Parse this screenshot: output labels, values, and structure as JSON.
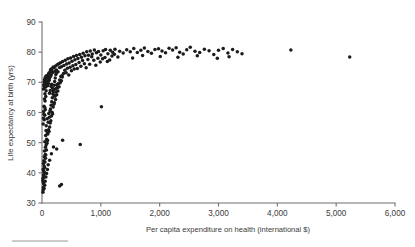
{
  "chart_data": {
    "type": "scatter",
    "title": "",
    "xlabel": "Per capita expenditure on health (international $)",
    "ylabel": "Life expectancy at birth (yrs)",
    "xlim": [
      0,
      6000
    ],
    "ylim": [
      30,
      90
    ],
    "xticks": [
      0,
      1000,
      2000,
      3000,
      4000,
      5000,
      6000
    ],
    "xticklabels": [
      "0",
      "1,000",
      "2,000",
      "3,000",
      "4,000",
      "5,000",
      "6,000"
    ],
    "yticks": [
      30,
      40,
      50,
      60,
      70,
      80,
      90
    ],
    "yticklabels": [
      "30",
      "40",
      "50",
      "60",
      "70",
      "80",
      "90"
    ],
    "grid": false,
    "legend": false,
    "marker_color": "#1b1b1b",
    "axis_color": "#6f6f6f",
    "points": [
      [
        15,
        37.5
      ],
      [
        18,
        38.2
      ],
      [
        22,
        36.8
      ],
      [
        25,
        39.4
      ],
      [
        28,
        40.6
      ],
      [
        20,
        41.2
      ],
      [
        32,
        38.9
      ],
      [
        35,
        42.3
      ],
      [
        24,
        43.1
      ],
      [
        30,
        44.0
      ],
      [
        40,
        40.2
      ],
      [
        45,
        41.8
      ],
      [
        38,
        45.3
      ],
      [
        50,
        43.6
      ],
      [
        55,
        46.1
      ],
      [
        42,
        47.2
      ],
      [
        60,
        44.8
      ],
      [
        58,
        48.5
      ],
      [
        65,
        45.9
      ],
      [
        70,
        49.2
      ],
      [
        48,
        50.3
      ],
      [
        75,
        47.6
      ],
      [
        80,
        51.1
      ],
      [
        62,
        52.4
      ],
      [
        85,
        49.8
      ],
      [
        90,
        53.2
      ],
      [
        68,
        54.0
      ],
      [
        95,
        50.7
      ],
      [
        100,
        52.9
      ],
      [
        72,
        55.6
      ],
      [
        110,
        54.3
      ],
      [
        105,
        56.8
      ],
      [
        120,
        53.7
      ],
      [
        88,
        57.9
      ],
      [
        130,
        55.2
      ],
      [
        125,
        58.4
      ],
      [
        140,
        56.5
      ],
      [
        115,
        59.7
      ],
      [
        150,
        57.3
      ],
      [
        135,
        60.5
      ],
      [
        160,
        58.8
      ],
      [
        145,
        61.2
      ],
      [
        170,
        60.1
      ],
      [
        155,
        62.4
      ],
      [
        180,
        59.5
      ],
      [
        190,
        61.8
      ],
      [
        165,
        63.6
      ],
      [
        200,
        62.7
      ],
      [
        175,
        64.9
      ],
      [
        210,
        63.2
      ],
      [
        220,
        65.4
      ],
      [
        185,
        66.1
      ],
      [
        230,
        64.3
      ],
      [
        240,
        66.8
      ],
      [
        195,
        67.5
      ],
      [
        250,
        65.9
      ],
      [
        260,
        68.2
      ],
      [
        205,
        69.0
      ],
      [
        270,
        67.1
      ],
      [
        280,
        69.6
      ],
      [
        215,
        70.3
      ],
      [
        290,
        68.5
      ],
      [
        300,
        70.8
      ],
      [
        225,
        71.4
      ],
      [
        310,
        69.9
      ],
      [
        320,
        71.9
      ],
      [
        235,
        72.6
      ],
      [
        330,
        70.5
      ],
      [
        340,
        72.2
      ],
      [
        245,
        73.1
      ],
      [
        28,
        60.3
      ],
      [
        34,
        62.1
      ],
      [
        42,
        64.5
      ],
      [
        50,
        66.2
      ],
      [
        58,
        68.4
      ],
      [
        26,
        58.1
      ],
      [
        33,
        59.4
      ],
      [
        45,
        61.7
      ],
      [
        52,
        63.8
      ],
      [
        64,
        65.3
      ],
      [
        20,
        56.2
      ],
      [
        38,
        57.6
      ],
      [
        48,
        59.1
      ],
      [
        56,
        61.0
      ],
      [
        70,
        67.2
      ],
      [
        30,
        69.1
      ],
      [
        36,
        70.2
      ],
      [
        44,
        70.9
      ],
      [
        54,
        71.5
      ],
      [
        66,
        72.0
      ],
      [
        25,
        67.8
      ],
      [
        40,
        68.6
      ],
      [
        46,
        69.8
      ],
      [
        60,
        70.6
      ],
      [
        74,
        71.2
      ],
      [
        80,
        69.3
      ],
      [
        92,
        70.4
      ],
      [
        104,
        71.7
      ],
      [
        86,
        72.3
      ],
      [
        98,
        70.1
      ],
      [
        112,
        72.8
      ],
      [
        124,
        71.3
      ],
      [
        136,
        73.4
      ],
      [
        148,
        72.1
      ],
      [
        160,
        73.9
      ],
      [
        95,
        68.9
      ],
      [
        108,
        69.6
      ],
      [
        122,
        70.7
      ],
      [
        118,
        73.1
      ],
      [
        132,
        71.6
      ],
      [
        144,
        74.2
      ],
      [
        156,
        72.5
      ],
      [
        168,
        74.6
      ],
      [
        180,
        73.3
      ],
      [
        192,
        75.1
      ],
      [
        128,
        66.4
      ],
      [
        140,
        67.3
      ],
      [
        152,
        68.7
      ],
      [
        164,
        69.4
      ],
      [
        176,
        68.1
      ],
      [
        205,
        74.8
      ],
      [
        218,
        73.7
      ],
      [
        232,
        75.4
      ],
      [
        246,
        74.1
      ],
      [
        258,
        75.8
      ],
      [
        272,
        73.5
      ],
      [
        286,
        76.2
      ],
      [
        300,
        74.9
      ],
      [
        315,
        76.5
      ],
      [
        330,
        75.2
      ],
      [
        190,
        66.8
      ],
      [
        210,
        65.7
      ],
      [
        230,
        67.9
      ],
      [
        250,
        69.2
      ],
      [
        265,
        68.3
      ],
      [
        350,
        76.9
      ],
      [
        372,
        75.6
      ],
      [
        395,
        77.3
      ],
      [
        418,
        76.1
      ],
      [
        440,
        77.8
      ],
      [
        462,
        76.4
      ],
      [
        485,
        78.1
      ],
      [
        510,
        77.0
      ],
      [
        535,
        78.6
      ],
      [
        560,
        77.5
      ],
      [
        345,
        71.8
      ],
      [
        365,
        72.9
      ],
      [
        388,
        74.0
      ],
      [
        410,
        73.2
      ],
      [
        432,
        74.7
      ],
      [
        455,
        72.4
      ],
      [
        478,
        75.0
      ],
      [
        500,
        73.8
      ],
      [
        525,
        75.5
      ],
      [
        548,
        74.4
      ],
      [
        585,
        78.9
      ],
      [
        610,
        77.9
      ],
      [
        640,
        79.2
      ],
      [
        670,
        78.3
      ],
      [
        700,
        79.6
      ],
      [
        575,
        75.9
      ],
      [
        600,
        74.6
      ],
      [
        630,
        76.6
      ],
      [
        660,
        75.3
      ],
      [
        690,
        77.2
      ],
      [
        730,
        78.8
      ],
      [
        760,
        80.1
      ],
      [
        790,
        79.0
      ],
      [
        820,
        80.4
      ],
      [
        855,
        79.4
      ],
      [
        720,
        76.2
      ],
      [
        750,
        74.8
      ],
      [
        780,
        77.6
      ],
      [
        810,
        76.0
      ],
      [
        845,
        78.5
      ],
      [
        890,
        80.7
      ],
      [
        925,
        79.8
      ],
      [
        960,
        80.2
      ],
      [
        1000,
        79.1
      ],
      [
        1040,
        80.5
      ],
      [
        880,
        77.3
      ],
      [
        915,
        75.7
      ],
      [
        950,
        78.0
      ],
      [
        990,
        76.7
      ],
      [
        1030,
        77.8
      ],
      [
        1080,
        80.9
      ],
      [
        1120,
        79.5
      ],
      [
        1160,
        80.6
      ],
      [
        1200,
        80.0
      ],
      [
        1240,
        81.0
      ],
      [
        1070,
        78.2
      ],
      [
        1110,
        76.9
      ],
      [
        1150,
        77.4
      ],
      [
        1190,
        78.7
      ],
      [
        1230,
        79.3
      ],
      [
        1320,
        80.3
      ],
      [
        1380,
        79.7
      ],
      [
        1440,
        80.8
      ],
      [
        1500,
        80.1
      ],
      [
        1560,
        81.2
      ],
      [
        1620,
        79.9
      ],
      [
        1680,
        80.6
      ],
      [
        1740,
        81.4
      ],
      [
        1800,
        80.2
      ],
      [
        1860,
        79.6
      ],
      [
        1920,
        80.9
      ],
      [
        1980,
        81.1
      ],
      [
        2040,
        80.4
      ],
      [
        2100,
        79.8
      ],
      [
        2160,
        81.3
      ],
      [
        2220,
        80.7
      ],
      [
        2280,
        81.5
      ],
      [
        2340,
        80.0
      ],
      [
        2400,
        79.4
      ],
      [
        2460,
        80.8
      ],
      [
        2520,
        81.6
      ],
      [
        2600,
        80.3
      ],
      [
        2680,
        79.9
      ],
      [
        2760,
        81.0
      ],
      [
        2840,
        80.5
      ],
      [
        2920,
        79.2
      ],
      [
        3000,
        80.6
      ],
      [
        3080,
        81.2
      ],
      [
        3160,
        79.7
      ],
      [
        3240,
        80.9
      ],
      [
        3320,
        80.1
      ],
      [
        3400,
        79.5
      ],
      [
        1290,
        78.4
      ],
      [
        1540,
        78.1
      ],
      [
        1710,
        78.9
      ],
      [
        2010,
        78.6
      ],
      [
        2310,
        78.3
      ],
      [
        2640,
        78.8
      ],
      [
        2980,
        78.0
      ],
      [
        3180,
        78.5
      ],
      [
        4230,
        80.7
      ],
      [
        5230,
        78.4
      ],
      [
        1010,
        61.9
      ],
      [
        350,
        50.8
      ],
      [
        650,
        49.4
      ],
      [
        300,
        35.6
      ],
      [
        330,
        36.1
      ],
      [
        250,
        47.9
      ],
      [
        195,
        48.6
      ],
      [
        160,
        46.3
      ],
      [
        130,
        44.2
      ],
      [
        105,
        42.7
      ],
      [
        92,
        41.1
      ],
      [
        78,
        39.8
      ],
      [
        66,
        38.6
      ],
      [
        54,
        37.2
      ],
      [
        46,
        35.9
      ],
      [
        36,
        34.8
      ],
      [
        29,
        36.4
      ],
      [
        23,
        35.1
      ],
      [
        19,
        34.3
      ],
      [
        16,
        33.6
      ]
    ]
  },
  "footer": {
    "rule_present": true
  }
}
